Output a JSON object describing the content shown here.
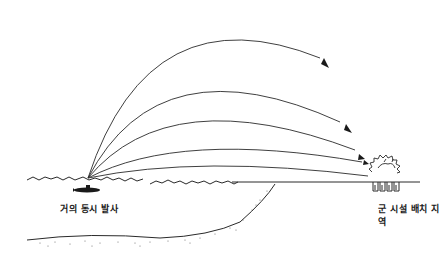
{
  "diagram": {
    "labels": {
      "launch": "거의 동시 발사",
      "target": "군 시설 배치 지역"
    },
    "elements": {
      "launcher": "submarine",
      "trajectories": 5,
      "target": "military-facility-under-explosion"
    },
    "colors": {
      "line": "#2a2a2a",
      "background": "#ffffff"
    }
  }
}
